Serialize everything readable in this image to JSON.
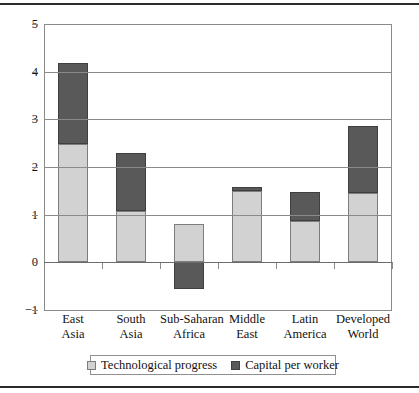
{
  "chart_data": {
    "type": "bar",
    "title": "",
    "subtitle": "",
    "xlabel": "",
    "ylabel": "",
    "stacked": true,
    "grid": true,
    "legend_position": "bottom",
    "ylim": [
      -1,
      5
    ],
    "yticks": [
      5,
      4,
      3,
      2,
      1,
      0,
      -1
    ],
    "ytick_labels": [
      "5",
      "4",
      "3",
      "2",
      "1",
      "0",
      "−1"
    ],
    "categories": [
      "East Asia",
      "South Asia",
      "Sub-Saharan Africa",
      "Middle East",
      "Latin America",
      "Developed World"
    ],
    "category_lines": [
      [
        "East",
        "Asia"
      ],
      [
        "South",
        "Asia"
      ],
      [
        "Sub-Saharan",
        "Africa"
      ],
      [
        "Middle",
        "East"
      ],
      [
        "Latin",
        "America"
      ],
      [
        "Developed",
        "World"
      ]
    ],
    "series": [
      {
        "name": "Technological progress",
        "color": "#d2d2d2",
        "values": [
          2.48,
          1.08,
          0.8,
          1.49,
          0.87,
          1.45
        ]
      },
      {
        "name": "Capital per worker",
        "color": "#595959",
        "values": [
          1.7,
          1.22,
          -0.55,
          0.09,
          0.6,
          1.4
        ]
      }
    ],
    "totals": [
      4.18,
      2.3,
      0.25,
      1.58,
      1.47,
      2.85
    ]
  },
  "legend": {
    "items": [
      {
        "label": "Technological progress",
        "swatch": "light-gray-swatch"
      },
      {
        "label": "Capital per worker",
        "swatch": "dark-gray-swatch"
      }
    ]
  },
  "colors": {
    "tech_fill": "#d2d2d2",
    "capital_fill": "#595959",
    "axis": "#8a8a8a",
    "rule": "#2b2b2b"
  }
}
